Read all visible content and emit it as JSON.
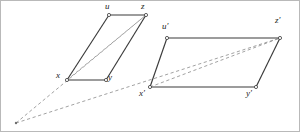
{
  "figure": {
    "type": "geometric-diagram",
    "canvas": {
      "width": 300,
      "height": 132
    },
    "colors": {
      "stroke_solid": "#3a3a3a",
      "stroke_dashed": "#8a8a8a",
      "vertex_fill": "#ffffff",
      "label_color": "#1b1b1b",
      "background": "#ffffff",
      "frame": "#b9b9b9"
    },
    "vanishing_point": {
      "name": "apex",
      "x": 15,
      "y": 122
    },
    "shapes": [
      {
        "name": "left-parallelogram",
        "vertices": [
          {
            "id": "x",
            "label": "x",
            "x": 66,
            "y": 79,
            "label_x": 56,
            "label_y": 71
          },
          {
            "id": "y",
            "label": "y",
            "x": 105,
            "y": 79,
            "label_x": 107,
            "label_y": 73
          },
          {
            "id": "z",
            "label": "z",
            "x": 145,
            "y": 14,
            "label_x": 140,
            "label_y": 0
          },
          {
            "id": "u",
            "label": "u",
            "x": 108,
            "y": 14,
            "label_x": 104,
            "label_y": 0
          }
        ],
        "edges": [
          {
            "from": "x",
            "to": "u"
          },
          {
            "from": "u",
            "to": "z"
          },
          {
            "from": "z",
            "to": "y"
          },
          {
            "from": "y",
            "to": "x"
          }
        ],
        "diagonal": {
          "from": "x",
          "to": "z",
          "style": "dashed"
        }
      },
      {
        "name": "right-parallelogram",
        "vertices": [
          {
            "id": "xp",
            "label": "x′",
            "x": 149,
            "y": 86,
            "label_x": 139,
            "label_y": 88
          },
          {
            "id": "yp",
            "label": "y′",
            "x": 255,
            "y": 86,
            "label_x": 246,
            "label_y": 88
          },
          {
            "id": "zp",
            "label": "z′",
            "x": 279,
            "y": 37,
            "label_x": 275,
            "label_y": 18
          },
          {
            "id": "up",
            "label": "u′",
            "x": 166,
            "y": 37,
            "label_x": 161,
            "label_y": 22
          }
        ],
        "edges": [
          {
            "from": "xp",
            "to": "up"
          },
          {
            "from": "up",
            "to": "zp"
          },
          {
            "from": "zp",
            "to": "yp"
          },
          {
            "from": "yp",
            "to": "xp"
          }
        ],
        "diagonal": {
          "from": "xp",
          "to": "zp",
          "style": "dashed"
        }
      }
    ],
    "projection_rays": [
      {
        "name": "ray-apex-to-z",
        "from": "apex",
        "through": "x",
        "to": "z",
        "style": "dashed"
      },
      {
        "name": "ray-apex-to-zp",
        "from": "apex",
        "through": "xp",
        "to": "zp",
        "style": "dashed"
      }
    ],
    "labels": [
      {
        "name": "label-u",
        "text": "u",
        "x": 104,
        "y": 1
      },
      {
        "name": "label-z",
        "text": "z",
        "x": 140,
        "y": 1
      },
      {
        "name": "label-x",
        "text": "x",
        "x": 55,
        "y": 71
      },
      {
        "name": "label-y",
        "text": "y",
        "x": 107,
        "y": 73
      },
      {
        "name": "label-u-prime",
        "text": "u′",
        "x": 161,
        "y": 22
      },
      {
        "name": "label-z-prime",
        "text": "z′",
        "x": 274,
        "y": 15
      },
      {
        "name": "label-x-prime",
        "text": "x′",
        "x": 138,
        "y": 88
      },
      {
        "name": "label-y-prime",
        "text": "y′",
        "x": 245,
        "y": 88
      }
    ]
  }
}
